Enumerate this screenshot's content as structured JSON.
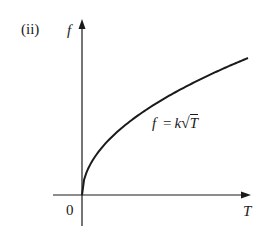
{
  "chart_data": {
    "type": "line",
    "panel_label": "(ii)",
    "title": "",
    "xlabel": "T",
    "ylabel": "f",
    "origin_label": "0",
    "annotation": "f = k√T",
    "equation": {
      "lhs": "f",
      "eq": "=",
      "coef": "k",
      "radicand": "T"
    },
    "series": [
      {
        "name": "f = k√T",
        "function": "sqrt",
        "x": [
          0,
          0.05,
          0.1,
          0.2,
          0.3,
          0.4,
          0.5,
          0.6,
          0.7,
          0.8,
          0.9,
          1.0
        ],
        "values": [
          0,
          0.224,
          0.316,
          0.447,
          0.548,
          0.632,
          0.707,
          0.775,
          0.837,
          0.894,
          0.949,
          1.0
        ]
      }
    ],
    "xlim": [
      0,
      1
    ],
    "ylim": [
      0,
      1
    ],
    "grid": false,
    "ticks": false,
    "legend": "none",
    "line_color": "#1a1a1a"
  }
}
